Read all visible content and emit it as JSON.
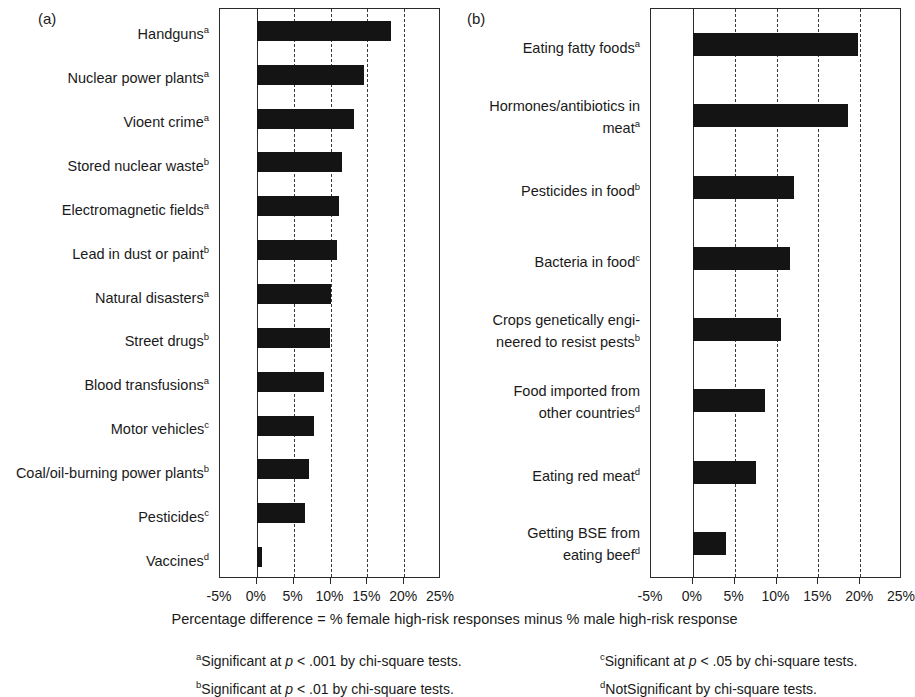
{
  "figure": {
    "axis_caption": "Percentage difference = % female high-risk responses minus % male high-risk response",
    "panel_a_tag": "(a)",
    "panel_b_tag": "(b)"
  },
  "footnotes": {
    "a": {
      "marker": "a",
      "text": "Significant at ",
      "stat": "p",
      "rest": " < .001 by chi-square tests."
    },
    "b": {
      "marker": "b",
      "text": "Significant at ",
      "stat": "p",
      "rest": " < .01 by chi-square tests."
    },
    "c": {
      "marker": "c",
      "text": "Significant at ",
      "stat": "p",
      "rest": " < .05 by chi-square tests."
    },
    "d": {
      "marker": "d",
      "text": "NotSignificant  by chi-square tests.",
      "stat": "",
      "rest": ""
    }
  },
  "chart_data": [
    {
      "type": "bar",
      "panel": "(a)",
      "orientation": "horizontal",
      "title": "",
      "xlabel": "Percentage difference = % female high-risk responses minus % male high-risk response",
      "ylabel": "",
      "xlim": [
        -5,
        25
      ],
      "ticks": [
        -5,
        0,
        5,
        10,
        15,
        20,
        25
      ],
      "tick_labels": [
        "-5%",
        "0%",
        "5%",
        "10%",
        "15%",
        "20%",
        "25%"
      ],
      "grid": true,
      "legend": "none",
      "categories": [
        "Handguns",
        "Nuclear power plants",
        "Vioent crime",
        "Stored nuclear waste",
        "Electromagnetic fields",
        "Lead in dust or paint",
        "Natural disasters",
        "Street drugs",
        "Blood transfusions",
        "Motor vehicles",
        "Coal/oil-burning power plants",
        "Pesticides",
        "Vaccines"
      ],
      "significance": [
        "a",
        "a",
        "a",
        "b",
        "a",
        "b",
        "a",
        "b",
        "a",
        "c",
        "b",
        "c",
        "d"
      ],
      "values": [
        18.2,
        14.5,
        13.2,
        11.5,
        11.1,
        10.9,
        10.1,
        9.9,
        9.1,
        7.7,
        7.1,
        6.5,
        0.7
      ]
    },
    {
      "type": "bar",
      "panel": "(b)",
      "orientation": "horizontal",
      "title": "",
      "xlabel": "Percentage difference = % female high-risk responses minus % male high-risk response",
      "ylabel": "",
      "xlim": [
        -5,
        25
      ],
      "ticks": [
        -5,
        0,
        5,
        10,
        15,
        20,
        25
      ],
      "tick_labels": [
        "-5%",
        "0%",
        "5%",
        "10%",
        "15%",
        "20%",
        "25%"
      ],
      "grid": true,
      "legend": "none",
      "categories": [
        "Eating fatty foods",
        "Hormones/antibiotics in\nmeat",
        "Pesticides in food",
        "Bacteria in food",
        "Crops genetically engi-\nneered to resist pests",
        "Food imported from\nother countries",
        "Eating red meat",
        "Getting BSE from\neating beef"
      ],
      "significance": [
        "a",
        "a",
        "b",
        "c",
        "b",
        "d",
        "d",
        "d"
      ],
      "values": [
        19.7,
        18.5,
        12.1,
        11.6,
        10.5,
        8.6,
        7.6,
        4.0
      ]
    }
  ]
}
